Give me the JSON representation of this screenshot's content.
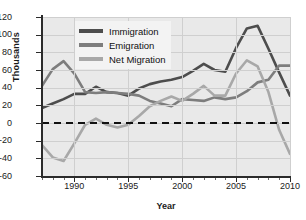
{
  "chart_data": {
    "type": "line",
    "title": "",
    "xlabel": "Year",
    "ylabel": "Thousands",
    "xlim": [
      1987,
      2010
    ],
    "ylim": [
      -60,
      120
    ],
    "ytick_labels": [
      "120",
      "100",
      "80",
      "60",
      "40",
      "20",
      "0",
      "-20",
      "-40",
      "-60"
    ],
    "ytick_values": [
      120,
      100,
      80,
      60,
      40,
      20,
      0,
      -20,
      -40,
      -60
    ],
    "xtick_labels": [
      "1990",
      "1995",
      "2000",
      "2005",
      "2010"
    ],
    "xtick_values": [
      1990,
      1995,
      2000,
      2005,
      2010
    ],
    "grid": true,
    "legend_position": "top-left-inside",
    "zero_line": true,
    "x": [
      1987,
      1988,
      1989,
      1990,
      1991,
      1992,
      1993,
      1994,
      1995,
      1996,
      1997,
      1998,
      1999,
      2000,
      2001,
      2002,
      2003,
      2004,
      2005,
      2006,
      2007,
      2008,
      2009,
      2010
    ],
    "series": [
      {
        "name": "Immigration",
        "color": "#4d4d4d",
        "values": [
          17,
          22,
          27,
          33,
          33,
          41,
          35,
          34,
          31,
          39,
          44,
          47,
          49,
          52,
          59,
          67,
          60,
          58,
          85,
          107,
          110,
          84,
          57,
          31
        ]
      },
      {
        "name": "Emigration",
        "color": "#7d7d7d",
        "values": [
          42,
          61,
          70,
          56,
          35,
          34,
          35,
          34,
          33,
          31,
          25,
          22,
          19,
          27,
          26,
          25,
          29,
          27,
          29,
          36,
          46,
          49,
          65,
          65
        ]
      },
      {
        "name": "Net Migration",
        "color": "#a8a8a8",
        "values": [
          -25,
          -39,
          -43,
          -23,
          -2,
          5,
          -2,
          -5,
          -2,
          8,
          19,
          25,
          30,
          25,
          33,
          42,
          31,
          31,
          56,
          71,
          64,
          35,
          -8,
          -35
        ]
      }
    ]
  },
  "legend": {
    "items": [
      {
        "label": "Immigration",
        "color": "#4d4d4d"
      },
      {
        "label": "Emigration",
        "color": "#7d7d7d"
      },
      {
        "label": "Net Migration",
        "color": "#a8a8a8"
      }
    ]
  },
  "colors": {
    "plot_background": "#e9e9e9",
    "page_background": "#ffffff",
    "grid": "#cfcfcf",
    "axis": "#2b2b2b",
    "zero_line": "#111111",
    "legend_background": "#f3f3f3",
    "text": "#1a1a1a"
  }
}
